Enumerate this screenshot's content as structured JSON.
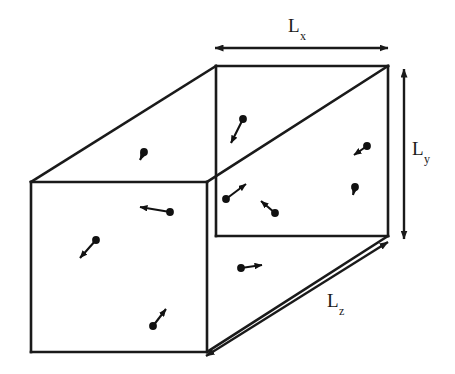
{
  "figure": {
    "type": "diagram",
    "width": 455,
    "height": 374,
    "background_color": "#ffffff",
    "stroke_color": "#1a1a1a"
  },
  "labels": {
    "lx": {
      "base": "L",
      "sub": "x",
      "text": "Lx"
    },
    "ly": {
      "base": "L",
      "sub": "y",
      "text": "Ly"
    },
    "lz": {
      "base": "L",
      "sub": "z",
      "text": "Lz"
    }
  },
  "box": {
    "back_face": {
      "x1": 216,
      "y1": 66,
      "x2": 388,
      "y2": 236
    },
    "front_face": {
      "x1": 31,
      "y1": 182,
      "x2": 207,
      "y2": 352
    },
    "depth_vector": {
      "dx": -185,
      "dy": 116
    }
  },
  "dimension_arrows": [
    {
      "name": "lx-arrow",
      "x1": 214,
      "y1": 48,
      "x2": 389,
      "y2": 48,
      "double_headed": true
    },
    {
      "name": "ly-arrow",
      "x1": 404,
      "y1": 68,
      "x2": 404,
      "y2": 240,
      "double_headed": true
    },
    {
      "name": "lz-arrow",
      "x1": 389,
      "y1": 241,
      "x2": 205,
      "y2": 357,
      "double_headed": true
    }
  ],
  "particles": [
    {
      "id": 1,
      "dot": [
        243,
        119
      ],
      "tip": [
        231,
        143
      ]
    },
    {
      "id": 2,
      "dot": [
        144,
        152
      ],
      "tip": [
        140,
        161
      ]
    },
    {
      "id": 3,
      "dot": [
        367,
        146
      ],
      "tip": [
        353,
        155
      ]
    },
    {
      "id": 4,
      "dot": [
        226,
        199
      ],
      "tip": [
        246,
        183
      ]
    },
    {
      "id": 5,
      "dot": [
        275,
        213
      ],
      "tip": [
        261,
        201
      ]
    },
    {
      "id": 6,
      "dot": [
        355,
        187
      ],
      "tip": [
        353,
        196
      ]
    },
    {
      "id": 7,
      "dot": [
        170,
        212
      ],
      "tip": [
        139,
        207
      ]
    },
    {
      "id": 8,
      "dot": [
        96,
        240
      ],
      "tip": [
        79,
        259
      ]
    },
    {
      "id": 9,
      "dot": [
        241,
        268
      ],
      "tip": [
        263,
        265
      ]
    },
    {
      "id": 10,
      "dot": [
        153,
        326
      ],
      "tip": [
        166,
        308
      ]
    }
  ]
}
